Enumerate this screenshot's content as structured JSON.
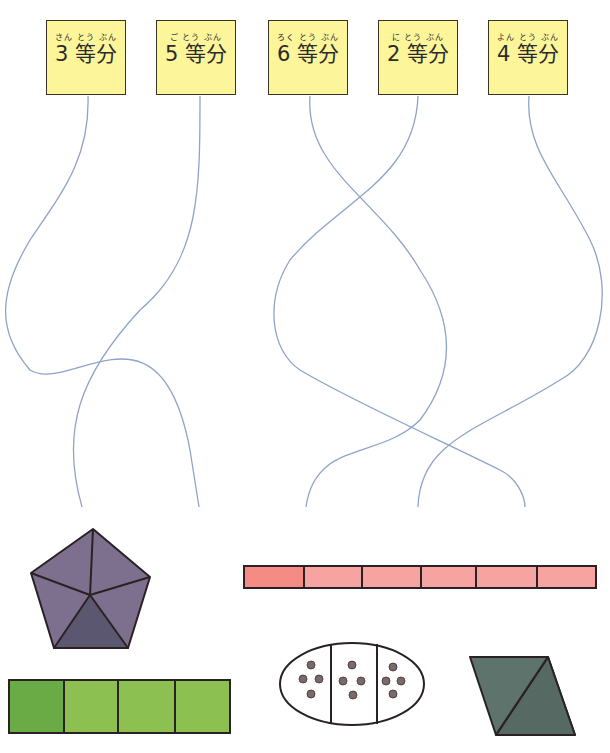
{
  "labels": [
    {
      "ruby": "さん とう ぶん",
      "text": "3 等分",
      "divisions": 3
    },
    {
      "ruby": "ご とう ぶん",
      "text": "5 等分",
      "divisions": 5
    },
    {
      "ruby": "ろく とう ぶん",
      "text": "6 等分",
      "divisions": 6
    },
    {
      "ruby": "に とう ぶん",
      "text": "2 等分",
      "divisions": 2
    },
    {
      "ruby": "よん とう ぶん",
      "text": "4 等分",
      "divisions": 4
    }
  ],
  "shapes": [
    {
      "name": "pentagon",
      "parts": 5,
      "color": "#7d6f8e",
      "shaded_color": "#5b5770"
    },
    {
      "name": "pink-bar",
      "parts": 6,
      "color": "#f7a3a2",
      "shaded_color": "#f48b84"
    },
    {
      "name": "green-bar",
      "parts": 4,
      "color": "#8cc152",
      "shaded_color": "#6aab45"
    },
    {
      "name": "oval-with-dots",
      "parts": 3,
      "dots_per_part": 4,
      "dot_color": "#7a6a6a"
    },
    {
      "name": "parallelogram",
      "parts": 2,
      "color": "#5f736d",
      "shaded_color": "#566a63"
    }
  ],
  "colors": {
    "label_fill": "#fdf59a",
    "line": "#8ea3c9",
    "outline": "#2a2222"
  }
}
